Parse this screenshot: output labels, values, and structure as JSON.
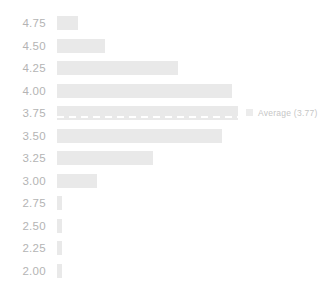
{
  "chart_data": {
    "type": "bar",
    "orientation": "horizontal",
    "title": "",
    "xlabel": "",
    "ylabel": "",
    "grid": false,
    "legend": false,
    "categories": [
      "4.75",
      "4.50",
      "4.25",
      "4.00",
      "3.75",
      "3.50",
      "3.25",
      "3.00",
      "2.75",
      "2.50",
      "2.25",
      "2.00"
    ],
    "values": [
      21,
      48,
      121,
      175,
      181,
      165,
      96,
      40,
      5,
      5,
      5,
      5
    ],
    "xlim": [
      0,
      200
    ],
    "annotations": [
      {
        "label": "Average (3.77)",
        "value": 3.77,
        "style": "dashed-line",
        "attached_to_category": "3.75"
      }
    ]
  },
  "axis": {
    "ticks": [
      {
        "label": "4.75"
      },
      {
        "label": "4.50"
      },
      {
        "label": "4.25"
      },
      {
        "label": "4.00"
      },
      {
        "label": "3.75"
      },
      {
        "label": "3.50"
      },
      {
        "label": "3.25"
      },
      {
        "label": "3.00"
      },
      {
        "label": "2.75"
      },
      {
        "label": "2.50"
      },
      {
        "label": "2.25"
      },
      {
        "label": "2.00"
      }
    ]
  },
  "average": {
    "annotation_text": "Average (3.77)"
  },
  "colors": {
    "bar": "#e9e9e9",
    "tick_label": "#b4b4b4",
    "annotation": "#c6c6c6",
    "dash": "#ffffff",
    "background": "#ffffff"
  }
}
